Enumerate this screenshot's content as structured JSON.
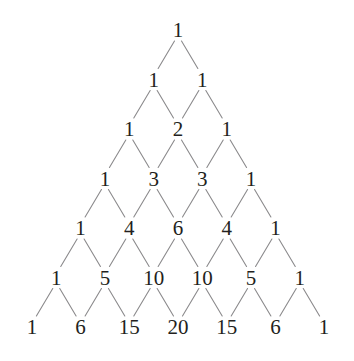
{
  "figure": {
    "name": "pascals-triangle",
    "background_color": "#ffffff",
    "text_color": "#231f20",
    "edge_color": "#8b8a8c",
    "edge_width": 1.1,
    "rows_count": 7,
    "geometry": {
      "width": 354,
      "height": 361,
      "apex_x": 178,
      "apex_y": 30,
      "row_spacing": 49.5,
      "column_spacing": 48.7,
      "node_gap_top": 11,
      "node_gap_bottom": 11
    }
  },
  "chart_data": {
    "type": "diagram",
    "rows": [
      {
        "index": 0,
        "values": [
          1
        ]
      },
      {
        "index": 1,
        "values": [
          1,
          1
        ]
      },
      {
        "index": 2,
        "values": [
          1,
          2,
          1
        ]
      },
      {
        "index": 3,
        "values": [
          1,
          3,
          3,
          1
        ]
      },
      {
        "index": 4,
        "values": [
          1,
          4,
          6,
          4,
          1
        ]
      },
      {
        "index": 5,
        "values": [
          1,
          5,
          10,
          10,
          5,
          1
        ]
      },
      {
        "index": 6,
        "values": [
          1,
          6,
          15,
          20,
          15,
          6,
          1
        ]
      }
    ],
    "row_labels": [
      "1",
      "1 1",
      "1 2 1",
      "1 3 3 1",
      "1 4 6 4 1",
      "1 5 10 10 5 1",
      "1 6 15 20 15 6 1"
    ],
    "xlabel": "",
    "ylabel": "",
    "legend": [],
    "grid": false
  }
}
